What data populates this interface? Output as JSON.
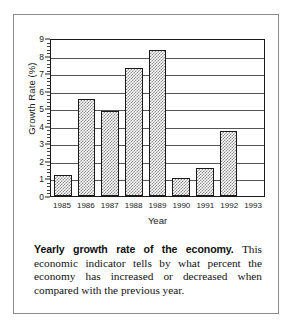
{
  "chart_data": {
    "type": "bar",
    "title": "",
    "xlabel": "Year",
    "ylabel": "Growth Rate (%)",
    "categories": [
      "1985",
      "1986",
      "1987",
      "1988",
      "1989",
      "1990",
      "1991",
      "1992",
      "1993"
    ],
    "values": [
      1.2,
      5.5,
      4.85,
      7.3,
      8.3,
      1.0,
      1.6,
      3.7,
      0
    ],
    "ylim": [
      0,
      9
    ],
    "ytick_labels": [
      "0",
      "1",
      "2",
      "3",
      "4",
      "5",
      "6",
      "7",
      "8",
      "9"
    ],
    "ytick_values": [
      0,
      1,
      2,
      3,
      4,
      5,
      6,
      7,
      8,
      9
    ],
    "grid": "horizontal",
    "legend": "none",
    "bar_fill": "checkered-gray-hatch"
  },
  "caption": {
    "lead": "Yearly growth rate of the economy.",
    "body": " This economic indicator tells by what percent the economy has increased or decreased when compared with the previous year."
  },
  "colors": {
    "frame": "#8c8c8c",
    "axis": "#1a1a1a",
    "grid": "#545454",
    "bar_pattern": "#8a8a8a",
    "background": "#ffffff",
    "text": "#111111"
  }
}
